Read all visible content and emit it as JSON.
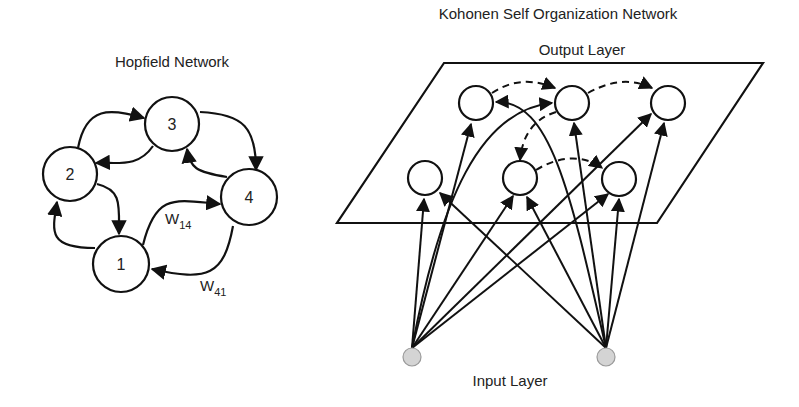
{
  "hopfield": {
    "title": "Hopfield Network",
    "nodes": [
      {
        "id": "1",
        "label": "1"
      },
      {
        "id": "2",
        "label": "2"
      },
      {
        "id": "3",
        "label": "3"
      },
      {
        "id": "4",
        "label": "4"
      }
    ],
    "edges": [
      {
        "from": "2",
        "to": "3"
      },
      {
        "from": "3",
        "to": "2"
      },
      {
        "from": "3",
        "to": "4"
      },
      {
        "from": "4",
        "to": "3"
      },
      {
        "from": "2",
        "to": "1"
      },
      {
        "from": "1",
        "to": "2"
      },
      {
        "from": "1",
        "to": "4",
        "weight": "W14"
      },
      {
        "from": "4",
        "to": "1",
        "weight": "W41"
      }
    ],
    "weights": {
      "w14": {
        "base": "W",
        "sub": "14"
      },
      "w41": {
        "base": "W",
        "sub": "41"
      }
    }
  },
  "kohonen": {
    "title": "Kohonen Self Organization Network",
    "output_layer_label": "Output Layer",
    "input_layer_label": "Input Layer",
    "output_nodes_count": 6,
    "input_nodes_count": 2,
    "colors": {
      "input_node_fill": "#d4d4d4",
      "input_node_stroke": "#9a9a9a",
      "line": "#111111"
    }
  }
}
